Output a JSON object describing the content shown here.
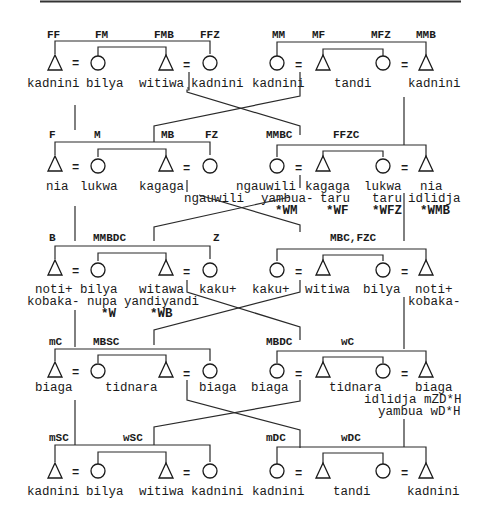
{
  "diagram": {
    "rows": [
      {
        "left": {
          "labels": [
            "FF",
            "FM",
            "FMB",
            "FFZ"
          ],
          "terms": [
            [
              "kadnini"
            ],
            [
              "bilya"
            ],
            [
              "witiwa"
            ],
            [
              "kadnini"
            ]
          ]
        },
        "right": {
          "labels": [
            "MM",
            "MF",
            "MFZ",
            "MMB"
          ],
          "terms": [
            [
              "kadnini"
            ],
            [
              "tandi"
            ],
            [
              ""
            ],
            [
              "kadnini"
            ]
          ]
        }
      },
      {
        "left": {
          "labels": [
            "F",
            "M",
            "MB",
            "FZ"
          ],
          "terms": [
            [
              "nia"
            ],
            [
              "lukwa"
            ],
            [
              "kagaga"
            ],
            [
              "ngauwili"
            ]
          ]
        },
        "right": {
          "labels": [
            "MMBC",
            "FFZC",
            "",
            ""
          ],
          "terms": [
            [
              "ngauwili",
              "yambua-",
              "*WM"
            ],
            [
              "kagaga",
              "taru",
              "*WF"
            ],
            [
              "lukwa",
              "taru",
              "*WFZ"
            ],
            [
              "nia",
              "idlidja",
              "*WMB"
            ]
          ]
        }
      },
      {
        "left": {
          "labels": [
            "B",
            "MMBDC",
            "",
            "Z"
          ],
          "terms": [
            [
              "noti+",
              "kobaka-"
            ],
            [
              "bilya",
              "nupa",
              "*W"
            ],
            [
              "witawa",
              "yandiyandi",
              "*WB"
            ],
            [
              "kaku+"
            ]
          ]
        },
        "right": {
          "labels": [
            "MBC,FZC",
            "",
            "",
            ""
          ],
          "terms": [
            [
              "kaku+"
            ],
            [
              "witiwa"
            ],
            [
              "bilya"
            ],
            [
              "noti+",
              "kobaka-"
            ]
          ]
        }
      },
      {
        "left": {
          "labels": [
            "mC",
            "MBSC",
            "",
            ""
          ],
          "terms": [
            [
              "biaga"
            ],
            [
              "tidnara"
            ],
            [
              ""
            ],
            [
              "biaga"
            ]
          ]
        },
        "right": {
          "labels": [
            "MBDC",
            "wC",
            "",
            ""
          ],
          "terms": [
            [
              "biaga"
            ],
            [
              "tidnara"
            ],
            [
              ""
            ],
            [
              "biaga",
              "idlidja mZD*H",
              "yambua wD*H"
            ]
          ]
        }
      },
      {
        "left": {
          "labels": [
            "mSC",
            "wSC",
            "",
            ""
          ],
          "terms": [
            [
              "kadnini"
            ],
            [
              "bilya"
            ],
            [
              "witiwa"
            ],
            [
              "kadnini"
            ]
          ]
        },
        "right": {
          "labels": [
            "mDC",
            "wDC",
            "",
            ""
          ],
          "terms": [
            [
              "kadnini"
            ],
            [
              "tandi"
            ],
            [
              ""
            ],
            [
              "kadnini"
            ]
          ]
        }
      }
    ],
    "marriage_symbol": "=",
    "symbols": {
      "male": "triangle",
      "female": "circle"
    }
  }
}
